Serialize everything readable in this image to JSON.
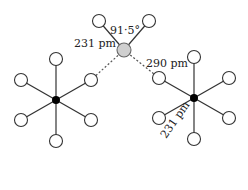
{
  "diagram": {
    "colors": {
      "bond": "#333333",
      "atom_fill": "#ffffff",
      "atom_stroke": "#333333",
      "metal_fill": "#000000",
      "bridge_fill": "#cfcfcf"
    },
    "labels": {
      "angle": "91·5°",
      "bridge_bond": "231 pm",
      "long_contact": "290 pm",
      "octahedral_bond": "231 pm"
    },
    "bridge_atom": {
      "x": 124,
      "y": 50
    },
    "bridge_ligands": [
      {
        "x": 99,
        "y": 21
      },
      {
        "x": 149,
        "y": 21
      }
    ],
    "left_centre": {
      "x": 56,
      "y": 100
    },
    "right_centre": {
      "x": 194,
      "y": 98
    }
  }
}
